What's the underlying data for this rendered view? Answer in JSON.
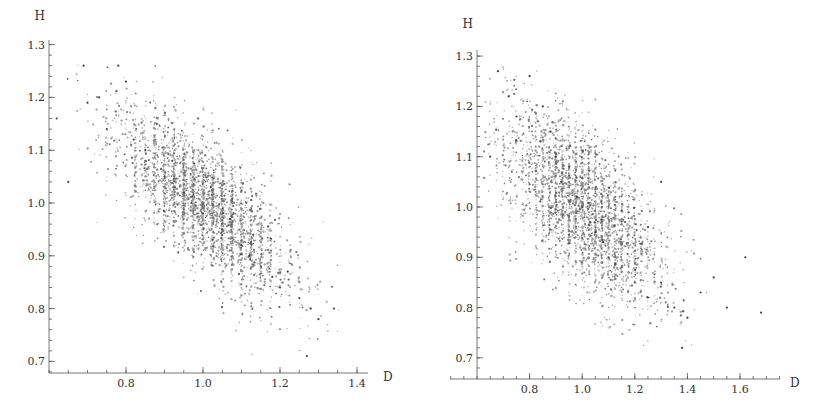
{
  "chart_data": [
    {
      "type": "scatter",
      "title": "",
      "xlabel": "D",
      "ylabel": "H",
      "xlim": [
        0.6,
        1.45
      ],
      "ylim": [
        0.68,
        1.3
      ],
      "xticks": [
        "0.8",
        "1.0",
        "1.2",
        "1.4"
      ],
      "xtick_values": [
        0.8,
        1.0,
        1.2,
        1.4
      ],
      "yticks": [
        "0.7",
        "0.8",
        "0.9",
        "1.0",
        "1.1",
        "1.2",
        "1.3"
      ],
      "ytick_values": [
        0.7,
        0.8,
        0.9,
        1.0,
        1.1,
        1.2,
        1.3
      ],
      "grid": false,
      "legend": null,
      "point_count_approx": 3000,
      "distribution": {
        "mean_d": 1.0,
        "mean_h": 1.0,
        "sd_d": 0.11,
        "sd_h": 0.085,
        "correlation": -0.72,
        "d_min": 0.62,
        "d_max": 1.38,
        "h_min": 0.71,
        "h_max": 1.27,
        "vertical_banding": true
      },
      "sample_points": [
        [
          0.62,
          1.16
        ],
        [
          0.65,
          1.04
        ],
        [
          0.69,
          1.26
        ],
        [
          0.7,
          1.19
        ],
        [
          0.73,
          1.2
        ],
        [
          0.75,
          1.14
        ],
        [
          0.78,
          1.26
        ],
        [
          0.8,
          1.23
        ],
        [
          0.82,
          1.12
        ],
        [
          0.85,
          1.1
        ],
        [
          0.88,
          1.15
        ],
        [
          0.9,
          1.05
        ],
        [
          0.92,
          1.08
        ],
        [
          0.95,
          1.02
        ],
        [
          0.97,
          1.0
        ],
        [
          1.0,
          0.98
        ],
        [
          1.02,
          1.03
        ],
        [
          1.05,
          0.95
        ],
        [
          1.07,
          0.97
        ],
        [
          1.1,
          0.92
        ],
        [
          1.12,
          0.9
        ],
        [
          1.15,
          0.88
        ],
        [
          1.18,
          0.86
        ],
        [
          1.2,
          0.84
        ],
        [
          1.22,
          0.87
        ],
        [
          1.25,
          0.82
        ],
        [
          1.28,
          0.8
        ],
        [
          1.3,
          0.78
        ],
        [
          1.27,
          0.71
        ],
        [
          1.34,
          0.8
        ]
      ]
    },
    {
      "type": "scatter",
      "title": "",
      "xlabel": "D",
      "ylabel": "H",
      "xlim": [
        0.6,
        1.75
      ],
      "ylim": [
        0.66,
        1.3
      ],
      "xticks": [
        "0.8",
        "1.0",
        "1.2",
        "1.4",
        "1.6"
      ],
      "xtick_values": [
        0.8,
        1.0,
        1.2,
        1.4,
        1.6
      ],
      "yticks": [
        "0.7",
        "0.8",
        "0.9",
        "1.0",
        "1.1",
        "1.2",
        "1.3"
      ],
      "ytick_values": [
        0.7,
        0.8,
        0.9,
        1.0,
        1.1,
        1.2,
        1.3
      ],
      "grid": false,
      "legend": null,
      "point_count_approx": 3000,
      "distribution": {
        "mean_d": 1.0,
        "mean_h": 1.0,
        "sd_d": 0.15,
        "sd_h": 0.095,
        "correlation": -0.62,
        "d_min": 0.62,
        "d_max": 1.7,
        "h_min": 0.7,
        "h_max": 1.28,
        "vertical_banding": true
      },
      "sample_points": [
        [
          0.65,
          1.1
        ],
        [
          0.68,
          1.27
        ],
        [
          0.72,
          1.22
        ],
        [
          0.75,
          1.18
        ],
        [
          0.8,
          1.26
        ],
        [
          0.85,
          1.2
        ],
        [
          0.88,
          1.15
        ],
        [
          0.9,
          1.1
        ],
        [
          0.92,
          1.05
        ],
        [
          0.95,
          1.08
        ],
        [
          0.98,
          1.02
        ],
        [
          1.0,
          1.0
        ],
        [
          1.03,
          0.97
        ],
        [
          1.05,
          0.95
        ],
        [
          1.08,
          0.93
        ],
        [
          1.1,
          0.9
        ],
        [
          1.15,
          0.88
        ],
        [
          1.2,
          0.85
        ],
        [
          1.25,
          0.82
        ],
        [
          1.3,
          0.85
        ],
        [
          1.35,
          0.8
        ],
        [
          1.4,
          0.78
        ],
        [
          1.45,
          0.83
        ],
        [
          1.5,
          0.86
        ],
        [
          1.55,
          0.8
        ],
        [
          1.62,
          0.9
        ],
        [
          1.68,
          0.79
        ],
        [
          1.25,
          0.96
        ],
        [
          1.3,
          1.05
        ],
        [
          1.38,
          0.72
        ]
      ]
    }
  ]
}
